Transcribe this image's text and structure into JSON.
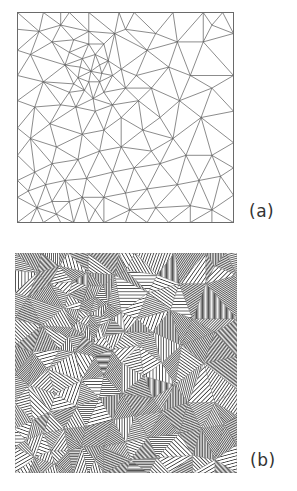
{
  "figure": {
    "panels": [
      {
        "id": "a",
        "label": "(a)",
        "type": "triangular-mesh-wireframe",
        "stroke": "#5a5a5a",
        "border": "#6a6a6a"
      },
      {
        "id": "b",
        "label": "(b)",
        "type": "triangular-mesh-hatched-fill"
      }
    ]
  },
  "mesh": {
    "nodes": [
      [
        0,
        0
      ],
      [
        0.12,
        0
      ],
      [
        0.2,
        0
      ],
      [
        0.24,
        0
      ],
      [
        0.33,
        0
      ],
      [
        0.47,
        0
      ],
      [
        0.54,
        0
      ],
      [
        0.72,
        0
      ],
      [
        0.86,
        0
      ],
      [
        0.95,
        0
      ],
      [
        1,
        0
      ],
      [
        1,
        0.1
      ],
      [
        1,
        0.3
      ],
      [
        1,
        0.47
      ],
      [
        1,
        0.62
      ],
      [
        1,
        0.74
      ],
      [
        1,
        0.87
      ],
      [
        1,
        1
      ],
      [
        0.9,
        1
      ],
      [
        0.8,
        1
      ],
      [
        0.7,
        1
      ],
      [
        0.6,
        1
      ],
      [
        0.5,
        1
      ],
      [
        0.4,
        1
      ],
      [
        0.33,
        1
      ],
      [
        0.26,
        1
      ],
      [
        0.2,
        1
      ],
      [
        0.12,
        1
      ],
      [
        0.06,
        1
      ],
      [
        0,
        1
      ],
      [
        0,
        0.88
      ],
      [
        0,
        0.8
      ],
      [
        0,
        0.68
      ],
      [
        0,
        0.55
      ],
      [
        0,
        0.42
      ],
      [
        0,
        0.3
      ],
      [
        0,
        0.18
      ],
      [
        0,
        0.08
      ],
      [
        0.1,
        0.09
      ],
      [
        0.06,
        0.2
      ],
      [
        0.16,
        0.14
      ],
      [
        0.26,
        0.13
      ],
      [
        0.33,
        0.09
      ],
      [
        0.4,
        0.15
      ],
      [
        0.3,
        0.22
      ],
      [
        0.22,
        0.25
      ],
      [
        0.36,
        0.2
      ],
      [
        0.42,
        0.23
      ],
      [
        0.34,
        0.28
      ],
      [
        0.28,
        0.31
      ],
      [
        0.38,
        0.33
      ],
      [
        0.31,
        0.37
      ],
      [
        0.35,
        0.41
      ],
      [
        0.4,
        0.38
      ],
      [
        0.44,
        0.3
      ],
      [
        0.24,
        0.38
      ],
      [
        0.27,
        0.45
      ],
      [
        0.36,
        0.47
      ],
      [
        0.44,
        0.44
      ],
      [
        0.5,
        0.36
      ],
      [
        0.48,
        0.27
      ],
      [
        0.55,
        0.3
      ],
      [
        0.12,
        0.33
      ],
      [
        0.08,
        0.45
      ],
      [
        0.2,
        0.44
      ],
      [
        0.15,
        0.53
      ],
      [
        0.06,
        0.6
      ],
      [
        0.18,
        0.64
      ],
      [
        0.3,
        0.58
      ],
      [
        0.4,
        0.56
      ],
      [
        0.48,
        0.5
      ],
      [
        0.56,
        0.42
      ],
      [
        0.62,
        0.36
      ],
      [
        0.7,
        0.26
      ],
      [
        0.6,
        0.18
      ],
      [
        0.64,
        0.1
      ],
      [
        0.74,
        0.14
      ],
      [
        0.86,
        0.14
      ],
      [
        0.8,
        0.3
      ],
      [
        0.9,
        0.36
      ],
      [
        0.75,
        0.42
      ],
      [
        0.85,
        0.5
      ],
      [
        0.66,
        0.5
      ],
      [
        0.58,
        0.56
      ],
      [
        0.72,
        0.6
      ],
      [
        0.62,
        0.66
      ],
      [
        0.48,
        0.64
      ],
      [
        0.38,
        0.66
      ],
      [
        0.28,
        0.7
      ],
      [
        0.16,
        0.72
      ],
      [
        0.08,
        0.76
      ],
      [
        0.05,
        0.85
      ],
      [
        0.13,
        0.82
      ],
      [
        0.22,
        0.8
      ],
      [
        0.32,
        0.79
      ],
      [
        0.44,
        0.76
      ],
      [
        0.54,
        0.74
      ],
      [
        0.66,
        0.72
      ],
      [
        0.78,
        0.68
      ],
      [
        0.9,
        0.68
      ],
      [
        0.94,
        0.78
      ],
      [
        0.84,
        0.8
      ],
      [
        0.74,
        0.82
      ],
      [
        0.6,
        0.84
      ],
      [
        0.5,
        0.86
      ],
      [
        0.4,
        0.88
      ],
      [
        0.3,
        0.88
      ],
      [
        0.24,
        0.9
      ],
      [
        0.16,
        0.9
      ],
      [
        0.09,
        0.93
      ],
      [
        0.18,
        0.96
      ],
      [
        0.36,
        0.94
      ],
      [
        0.64,
        0.93
      ],
      [
        0.8,
        0.92
      ],
      [
        0.9,
        0.94
      ],
      [
        0.52,
        0.94
      ],
      [
        0.2,
        0.06
      ],
      [
        0.5,
        0.08
      ],
      [
        0.9,
        0.06
      ],
      [
        0.45,
        0.1
      ],
      [
        0.33,
        0.15
      ],
      [
        0.24,
        0.19
      ],
      [
        0.38,
        0.25
      ],
      [
        0.29,
        0.26
      ],
      [
        0.33,
        0.33
      ],
      [
        0.39,
        0.29
      ],
      [
        0.26,
        0.34
      ]
    ]
  },
  "hatching": {
    "angles": [
      0,
      20,
      35,
      45,
      60,
      75,
      90,
      110,
      125,
      135,
      150,
      165
    ],
    "spacings": [
      1.2,
      1.6,
      2.0,
      2.6,
      3.2
    ],
    "ink": "#2a2a2a",
    "paper": "#ffffff"
  }
}
